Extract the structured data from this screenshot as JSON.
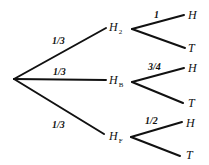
{
  "diagram": {
    "type": "probability-tree",
    "root": {
      "x": 14,
      "y": 79
    },
    "first_level": [
      {
        "id": "H2",
        "label": "H",
        "subscript": "2",
        "prob": "1/3",
        "node": {
          "x": 110,
          "y": 30
        },
        "prob_pos": {
          "x": 52,
          "y": 44
        },
        "children": [
          {
            "label": "H",
            "prob": "1",
            "x": 193,
            "y": 17,
            "prob_pos": {
              "x": 152,
              "y": 18
            }
          },
          {
            "label": "T",
            "x": 193,
            "y": 49
          }
        ]
      },
      {
        "id": "HB",
        "label": "H",
        "subscript": "B",
        "prob": "1/3",
        "node": {
          "x": 110,
          "y": 83
        },
        "prob_pos": {
          "x": 52,
          "y": 75
        },
        "children": [
          {
            "label": "H",
            "prob": "3/4",
            "x": 193,
            "y": 71,
            "prob_pos": {
              "x": 150,
              "y": 70
            }
          },
          {
            "label": "T",
            "x": 193,
            "y": 104
          }
        ]
      },
      {
        "id": "HF",
        "label": "H",
        "subscript": "F",
        "prob": "1/3",
        "node": {
          "x": 110,
          "y": 139
        },
        "prob_pos": {
          "x": 52,
          "y": 128
        },
        "children": [
          {
            "label": "H",
            "prob": "1/2",
            "x": 193,
            "y": 124,
            "prob_pos": {
              "x": 147,
              "y": 123
            }
          },
          {
            "label": "T",
            "x": 193,
            "y": 156
          }
        ]
      }
    ]
  },
  "text": {
    "p_h2": "1/3",
    "p_hb": "1/3",
    "p_hf": "1/3",
    "n_h2": "H",
    "n_h2_sub": "2",
    "n_hb": "H",
    "n_hb_sub": "B",
    "n_hf": "H",
    "n_hf_sub": "F",
    "p_h2_h": "1",
    "p_hb_h": "3/4",
    "p_hf_h": "1/2",
    "leaf_h": "H",
    "leaf_t": "T"
  }
}
